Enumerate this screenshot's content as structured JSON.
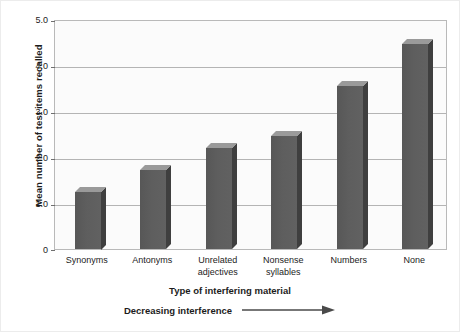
{
  "chart_data": {
    "type": "bar",
    "title": "",
    "xlabel": "Type of interfering material",
    "ylabel": "Mean number of test items recalled",
    "categories": [
      "Synonyms",
      "Antonyms",
      "Unrelated\nadjectives",
      "Nonsense\nsyllables",
      "Numbers",
      "None"
    ],
    "category_lines": [
      [
        "Synonyms"
      ],
      [
        "Antonyms"
      ],
      [
        "Unrelated",
        "adjectives"
      ],
      [
        "Nonsense",
        "syllables"
      ],
      [
        "Numbers"
      ],
      [
        "None"
      ]
    ],
    "values": [
      1.25,
      1.72,
      2.2,
      2.45,
      3.55,
      4.45
    ],
    "ylim": [
      0,
      5.0
    ],
    "ytick_values": [
      0,
      1.0,
      2.0,
      3.0,
      4.0,
      5.0
    ],
    "ytick_labels": [
      "0",
      "1.0",
      "2.0",
      "3.0",
      "4.0",
      "5.0"
    ],
    "grid": true,
    "legend": "none",
    "annotation": "Decreasing interference",
    "annotation_icon": "right-arrow-icon",
    "bar_color": "#5c5c5c",
    "bar_top_color": "#9a9a9a",
    "bar_side_color": "#3f3f3f",
    "grid_color": "#b4b4b4",
    "plot_background": "#fbfbfb",
    "axis_color": "#b9b9b9"
  }
}
